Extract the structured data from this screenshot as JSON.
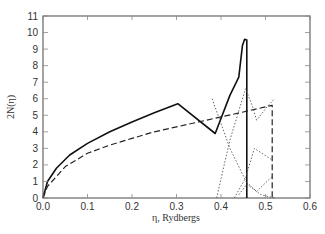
{
  "chart_data": {
    "type": "line",
    "title": "",
    "xlabel": "η, Rydbergs",
    "ylabel": "2N(η)",
    "xlim": [
      0.0,
      0.6
    ],
    "ylim": [
      0,
      11
    ],
    "xticks": [
      "0.0",
      "0.1",
      "0.2",
      "0.3",
      "0.4",
      "0.5",
      "0.6"
    ],
    "yticks": [
      "0",
      "1",
      "2",
      "3",
      "4",
      "5",
      "6",
      "7",
      "8",
      "9",
      "10",
      "11"
    ],
    "grid": false,
    "legend": null,
    "series": [
      {
        "name": "solid",
        "style": "solid",
        "x": [
          0.0,
          0.01,
          0.03,
          0.06,
          0.1,
          0.15,
          0.2,
          0.25,
          0.303,
          0.387,
          0.42,
          0.44,
          0.448,
          0.453,
          0.458,
          0.458
        ],
        "y": [
          0.0,
          1.0,
          1.8,
          2.6,
          3.3,
          4.0,
          4.6,
          5.15,
          5.7,
          3.9,
          6.2,
          7.3,
          9.2,
          9.6,
          9.55,
          0.0
        ]
      },
      {
        "name": "dashed",
        "style": "dashed",
        "x": [
          0.0,
          0.01,
          0.05,
          0.1,
          0.15,
          0.2,
          0.25,
          0.3,
          0.35,
          0.4,
          0.45,
          0.515,
          0.515
        ],
        "y": [
          0.0,
          0.7,
          1.9,
          2.7,
          3.2,
          3.6,
          4.0,
          4.3,
          4.6,
          4.9,
          5.2,
          5.6,
          0.0
        ]
      },
      {
        "name": "dotted-1",
        "style": "dotted",
        "x": [
          0.39,
          0.42,
          0.455,
          0.47,
          0.48,
          0.5,
          0.52
        ],
        "y": [
          0.0,
          3.5,
          6.6,
          5.6,
          4.7,
          5.4,
          6.0
        ]
      },
      {
        "name": "dotted-2",
        "style": "dotted",
        "x": [
          0.38,
          0.42,
          0.46,
          0.49,
          0.52
        ],
        "y": [
          6.0,
          3.0,
          0.8,
          0.2,
          0.0
        ]
      },
      {
        "name": "dotted-3",
        "style": "dotted",
        "x": [
          0.43,
          0.455,
          0.475,
          0.515
        ],
        "y": [
          0.0,
          1.2,
          3.0,
          2.3
        ]
      },
      {
        "name": "dotted-4",
        "style": "dotted",
        "x": [
          0.44,
          0.46,
          0.48,
          0.515
        ],
        "y": [
          0.2,
          0.9,
          0.4,
          1.3
        ]
      }
    ]
  },
  "axes": {
    "x_title": "η, Rydbergs",
    "y_title": "2N(η)"
  }
}
